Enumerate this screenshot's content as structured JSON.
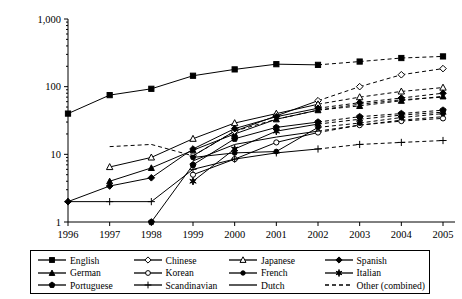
{
  "chart_data": {
    "type": "line",
    "title": "",
    "xlabel": "",
    "ylabel": "",
    "yscale": "log",
    "ylim": [
      1,
      1000
    ],
    "ytick_labels": [
      "1,000",
      "100",
      "10",
      "1"
    ],
    "ytick_values": [
      1000,
      100,
      10,
      1
    ],
    "grid": false,
    "legend_position": "bottom",
    "categories": [
      1996,
      1997,
      1998,
      1999,
      2000,
      2001,
      2002,
      2003,
      2004,
      2005
    ],
    "xtick_labels": [
      "1996",
      "1997",
      "1998",
      "1999",
      "2000",
      "2001",
      "2002",
      "2003",
      "2004",
      "2005"
    ],
    "solid_through": 2002,
    "annotation": "Lines are solid through 2002 and dashed (projected / other combined) from 2002 to 2005",
    "series": [
      {
        "name": "English",
        "marker": "square-filled",
        "x": [
          1996,
          1997,
          1998,
          1999,
          2000,
          2001,
          2002,
          2003,
          2004,
          2005
        ],
        "values": [
          40,
          75,
          93,
          145,
          180,
          215,
          210,
          235,
          265,
          280
        ]
      },
      {
        "name": "German",
        "marker": "triangle-filled",
        "x": [
          1997,
          1998,
          1999,
          2000,
          2001,
          2002,
          2003,
          2004,
          2005
        ],
        "values": [
          4,
          6.3,
          11.5,
          20,
          33,
          45,
          52,
          62,
          72
        ]
      },
      {
        "name": "Portuguese",
        "marker": "pentagon-filled",
        "x": [
          1998,
          1999,
          2000,
          2001,
          2002,
          2003,
          2004,
          2005
        ],
        "values": [
          1,
          7,
          17,
          25,
          30,
          36,
          40,
          45
        ]
      },
      {
        "name": "Chinese",
        "marker": "diamond-hollow",
        "x": [
          1999,
          2000,
          2001,
          2002,
          2003,
          2004,
          2005
        ],
        "values": [
          9.5,
          22,
          37,
          62,
          100,
          150,
          185
        ]
      },
      {
        "name": "Korean",
        "marker": "circle-hollow",
        "x": [
          1999,
          2000,
          2001,
          2002,
          2003,
          2004,
          2005
        ],
        "values": [
          5,
          8.5,
          15,
          21,
          27,
          31,
          34
        ]
      },
      {
        "name": "Scandinavian",
        "marker": "plus",
        "x": [
          1996,
          1997,
          1998,
          1999,
          2000,
          2001,
          2002,
          2003,
          2004,
          2005
        ],
        "values": [
          2,
          2,
          2,
          6,
          8.5,
          10.5,
          12,
          14,
          15,
          16
        ]
      },
      {
        "name": "Japanese",
        "marker": "triangle-hollow",
        "x": [
          1997,
          1998,
          1999,
          2000,
          2001,
          2002,
          2003,
          2004,
          2005
        ],
        "values": [
          6.5,
          9,
          17,
          29,
          40,
          55,
          70,
          85,
          97
        ]
      },
      {
        "name": "French",
        "marker": "circle-filled",
        "x": [
          1999,
          2000,
          2001,
          2002,
          2003,
          2004,
          2005
        ],
        "values": [
          9,
          10.5,
          11,
          25,
          29,
          35,
          40
        ]
      },
      {
        "name": "Dutch",
        "marker": "none",
        "x": [
          1999,
          2000,
          2001,
          2002,
          2003,
          2004,
          2005
        ],
        "values": [
          8,
          14,
          18,
          22,
          27,
          32,
          36
        ]
      },
      {
        "name": "Spanish",
        "marker": "diamond-filled",
        "x": [
          1996,
          1997,
          1998,
          1999,
          2000,
          2001,
          2002,
          2003,
          2004,
          2005
        ],
        "values": [
          2,
          3.4,
          4.5,
          12,
          24,
          36,
          48,
          58,
          68,
          80
        ]
      },
      {
        "name": "Italian",
        "marker": "star-filled",
        "x": [
          1999,
          2000,
          2001,
          2002,
          2003,
          2004,
          2005
        ],
        "values": [
          4,
          12,
          22,
          28,
          33,
          38,
          42
        ]
      },
      {
        "name": "Other (combined)",
        "marker": "none",
        "x": [
          1997,
          1998,
          1999,
          2000,
          2001,
          2002,
          2003,
          2004,
          2005
        ],
        "values": [
          13,
          14,
          9.5,
          22,
          33,
          45,
          55,
          64,
          70
        ],
        "dashed_all": true
      }
    ]
  },
  "legend": {
    "items": [
      {
        "label": "English",
        "marker": "square-filled",
        "dashed": false
      },
      {
        "label": "Chinese",
        "marker": "diamond-hollow",
        "dashed": false
      },
      {
        "label": "Japanese",
        "marker": "triangle-hollow",
        "dashed": false
      },
      {
        "label": "Spanish",
        "marker": "diamond-filled",
        "dashed": false
      },
      {
        "label": "German",
        "marker": "triangle-filled",
        "dashed": false
      },
      {
        "label": "Korean",
        "marker": "circle-hollow",
        "dashed": false
      },
      {
        "label": "French",
        "marker": "circle-filled",
        "dashed": false
      },
      {
        "label": "Italian",
        "marker": "star-filled",
        "dashed": false
      },
      {
        "label": "Portuguese",
        "marker": "pentagon-filled",
        "dashed": false
      },
      {
        "label": "Scandinavian",
        "marker": "plus",
        "dashed": false
      },
      {
        "label": "Dutch",
        "marker": "none",
        "dashed": false
      },
      {
        "label": "Other (combined)",
        "marker": "none",
        "dashed": true
      }
    ]
  }
}
